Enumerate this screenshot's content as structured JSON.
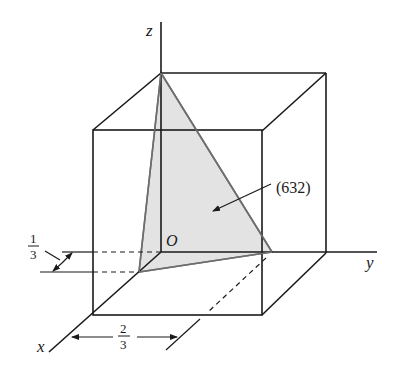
{
  "diagram": {
    "type": "miller-plane-in-unit-cube",
    "axes": {
      "x_label": "x",
      "y_label": "y",
      "z_label": "z",
      "origin_label": "O"
    },
    "plane": {
      "label": "(632)",
      "fill_color": "#e3e3e3",
      "edge_color": "#6e6e6e"
    },
    "dimensions": {
      "x_intercept_fraction": {
        "numerator": "1",
        "denominator": "3"
      },
      "y_offset_fraction": {
        "numerator": "2",
        "denominator": "3"
      }
    },
    "colors": {
      "line": "#1a1a1a",
      "background": "#ffffff"
    }
  }
}
